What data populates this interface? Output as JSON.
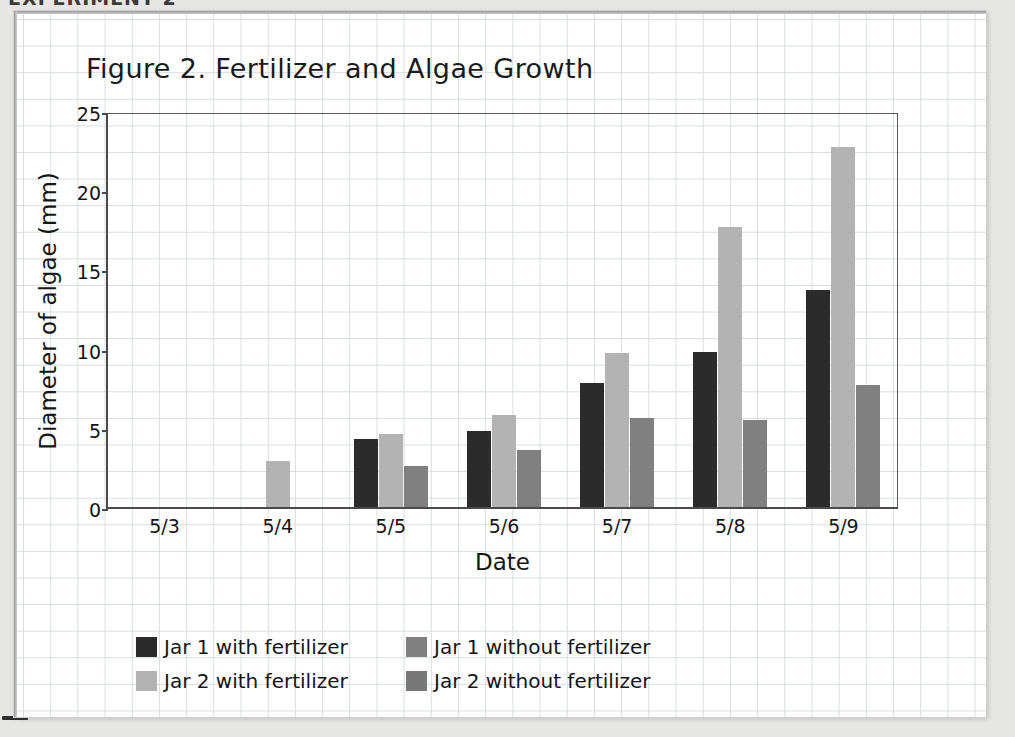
{
  "page": {
    "header_text": "EXPERIMENT 2"
  },
  "chart_data": {
    "type": "bar",
    "title": "Figure 2. Fertilizer and Algae Growth",
    "xlabel": "Date",
    "ylabel": "Diameter of algae (mm)",
    "categories": [
      "5/3",
      "5/4",
      "5/5",
      "5/6",
      "5/7",
      "5/8",
      "5/9"
    ],
    "ylim": [
      0,
      25
    ],
    "yticks": [
      0,
      5,
      10,
      15,
      20,
      25
    ],
    "grid": true,
    "legend_position": "bottom-left",
    "series": [
      {
        "name": "Jar 1 with fertilizer",
        "color": "#2b2b2b",
        "values": [
          0,
          0,
          4.3,
          4.8,
          7.8,
          9.8,
          13.7
        ]
      },
      {
        "name": "Jar 2 with fertilizer",
        "color": "#b3b3b3",
        "values": [
          0,
          2.9,
          4.6,
          5.8,
          9.7,
          17.7,
          22.7
        ]
      },
      {
        "name": "Jar 2 without fertilizer",
        "color": "#808080",
        "values": [
          0,
          0,
          2.6,
          3.6,
          5.6,
          5.5,
          7.7
        ]
      },
      {
        "name": "Jar 1 without fertilizer",
        "color": "#808080",
        "values": [
          0,
          0,
          0,
          0,
          0,
          0,
          0
        ]
      }
    ],
    "legend": [
      {
        "label": "Jar 1 with fertilizer",
        "color": "#2b2b2b"
      },
      {
        "label": "Jar 1 without fertilizer",
        "color": "#808080"
      },
      {
        "label": "Jar 2 with fertilizer",
        "color": "#b3b3b3"
      },
      {
        "label": "Jar 2 without fertilizer",
        "color": "#787878"
      }
    ]
  }
}
